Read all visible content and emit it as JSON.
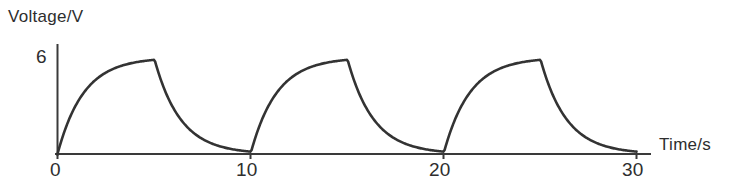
{
  "chart_data": {
    "type": "line",
    "title": "",
    "xlabel": "Time/s",
    "ylabel": "Voltage/V",
    "xlim": [
      0,
      30
    ],
    "ylim": [
      0,
      7
    ],
    "grid": false,
    "legend": null,
    "x_ticks": [
      "0",
      "10",
      "20",
      "30"
    ],
    "x_tick_values": [
      0,
      10,
      20,
      30
    ],
    "y_ticks": [
      "6"
    ],
    "y_tick_values": [
      6
    ],
    "period_seconds": 10,
    "peak_voltage": 6,
    "cycles": 3,
    "series": [
      {
        "name": "Voltage",
        "color": "#333333",
        "segments": [
          {
            "kind": "charge",
            "t_start": 0,
            "t_end": 5,
            "v_start": 0,
            "v_end": 6
          },
          {
            "kind": "discharge",
            "t_start": 5,
            "t_end": 10,
            "v_start": 6,
            "v_end": 0
          },
          {
            "kind": "charge",
            "t_start": 10,
            "t_end": 15,
            "v_start": 0,
            "v_end": 6
          },
          {
            "kind": "discharge",
            "t_start": 15,
            "t_end": 20,
            "v_start": 6,
            "v_end": 0
          },
          {
            "kind": "charge",
            "t_start": 20,
            "t_end": 25,
            "v_start": 0,
            "v_end": 6
          },
          {
            "kind": "discharge",
            "t_start": 25,
            "t_end": 30,
            "v_start": 6,
            "v_end": 0
          }
        ],
        "points": [
          {
            "t": 0,
            "v": 0.0
          },
          {
            "t": 0.5,
            "v": 2.22
          },
          {
            "t": 1.0,
            "v": 3.63
          },
          {
            "t": 1.5,
            "v": 4.52
          },
          {
            "t": 2.0,
            "v": 5.1
          },
          {
            "t": 2.5,
            "v": 5.46
          },
          {
            "t": 3.0,
            "v": 5.69
          },
          {
            "t": 3.5,
            "v": 5.83
          },
          {
            "t": 4.0,
            "v": 5.92
          },
          {
            "t": 4.5,
            "v": 5.98
          },
          {
            "t": 5.0,
            "v": 6.0
          },
          {
            "t": 5.5,
            "v": 3.78
          },
          {
            "t": 6.0,
            "v": 2.37
          },
          {
            "t": 6.5,
            "v": 1.48
          },
          {
            "t": 7.0,
            "v": 0.9
          },
          {
            "t": 7.5,
            "v": 0.54
          },
          {
            "t": 8.0,
            "v": 0.31
          },
          {
            "t": 8.5,
            "v": 0.17
          },
          {
            "t": 9.0,
            "v": 0.08
          },
          {
            "t": 9.5,
            "v": 0.02
          },
          {
            "t": 10.0,
            "v": 0.0
          }
        ]
      }
    ]
  },
  "axes": {
    "y_axis_label": "Voltage/V",
    "x_axis_label": "Time/s",
    "y_tick_6": "6",
    "x_tick_0": "0",
    "x_tick_10": "10",
    "x_tick_20": "20",
    "x_tick_30": "30"
  },
  "colors": {
    "curve": "#333333",
    "axis": "#3a3a3a",
    "text": "#2e2e2e",
    "background": "#ffffff"
  }
}
